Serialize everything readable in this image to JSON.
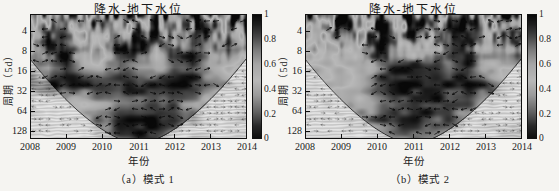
{
  "figure": {
    "panels": [
      {
        "title": "降水-地下水位",
        "ylabel": "周期（5d）",
        "xlabel": "年份",
        "caption": "（a）模式 1",
        "x_ticks": [
          "2008",
          "2009",
          "2010",
          "2011",
          "2012",
          "2013",
          "2014"
        ],
        "y_ticks": [
          "4",
          "8",
          "16",
          "32",
          "64",
          "128"
        ],
        "colorbar_ticks": [
          "1",
          "0.8",
          "0.6",
          "0.4",
          "0.2",
          "0"
        ]
      },
      {
        "title": "降水-地下水位",
        "ylabel": "周期（5d）",
        "xlabel": "年份",
        "caption": "（b）模式 2",
        "x_ticks": [
          "2008",
          "2009",
          "2010",
          "2011",
          "2012",
          "2013",
          "2014"
        ],
        "y_ticks": [
          "4",
          "8",
          "16",
          "32",
          "64",
          "128"
        ],
        "colorbar_ticks": [
          "1",
          "0.8",
          "0.6",
          "0.4",
          "0.2",
          "0"
        ]
      }
    ]
  },
  "chart_data": [
    {
      "type": "heatmap",
      "subtype": "wavelet-coherence",
      "title": "降水-地下水位",
      "xlabel": "年份",
      "ylabel": "周期（5d）",
      "caption": "（a）模式 1",
      "x_range": [
        2008,
        2014
      ],
      "x_tick_values": [
        2008,
        2009,
        2010,
        2011,
        2012,
        2013,
        2014
      ],
      "y_tick_values": [
        4,
        8,
        16,
        32,
        64,
        128
      ],
      "y_scale": "log2",
      "colorbar": {
        "min": 0,
        "max": 1,
        "ticks": [
          0,
          0.2,
          0.4,
          0.6,
          0.8,
          1
        ]
      },
      "features": [
        "cone-of-influence",
        "phase-arrows",
        "grayscale-print"
      ],
      "grid": {
        "x": [
          2008,
          2008.5,
          2009,
          2009.5,
          2010,
          2010.5,
          2011,
          2011.5,
          2012,
          2012.5,
          2013,
          2013.5,
          2014
        ],
        "periods": [
          3,
          6,
          12,
          22,
          32,
          45,
          90,
          150
        ],
        "values": [
          [
            0.85,
            0.3,
            0.9,
            0.5,
            0.85,
            0.95,
            0.4,
            0.9,
            0.6,
            0.9,
            0.35,
            0.85,
            0.6
          ],
          [
            0.5,
            0.9,
            0.7,
            0.4,
            0.9,
            0.5,
            0.85,
            0.9,
            0.45,
            0.95,
            0.8,
            0.5,
            0.85
          ],
          [
            0.5,
            0.8,
            0.95,
            0.5,
            0.4,
            0.9,
            0.95,
            0.5,
            0.85,
            0.95,
            0.55,
            0.9,
            0.5
          ],
          [
            0.75,
            0.55,
            0.9,
            0.6,
            0.5,
            0.8,
            0.6,
            0.55,
            0.75,
            0.85,
            0.6,
            0.5,
            0.45
          ],
          [
            0.9,
            0.95,
            0.95,
            0.9,
            0.95,
            0.9,
            0.85,
            0.9,
            0.95,
            0.9,
            0.8,
            0.7,
            0.6
          ],
          [
            0.45,
            0.5,
            0.55,
            0.5,
            0.6,
            0.7,
            0.8,
            0.85,
            0.75,
            0.65,
            0.5,
            0.45,
            0.4
          ],
          [
            0.35,
            0.4,
            0.45,
            0.55,
            0.75,
            0.9,
            0.95,
            0.95,
            0.9,
            0.8,
            0.5,
            0.4,
            0.35
          ],
          [
            0.4,
            0.4,
            0.45,
            0.5,
            0.65,
            0.8,
            0.9,
            0.85,
            0.6,
            0.3,
            0.35,
            0.4,
            0.4
          ]
        ]
      }
    },
    {
      "type": "heatmap",
      "subtype": "wavelet-coherence",
      "title": "降水-地下水位",
      "xlabel": "年份",
      "ylabel": "周期（5d）",
      "caption": "（b）模式 2",
      "x_range": [
        2008,
        2014
      ],
      "x_tick_values": [
        2008,
        2009,
        2010,
        2011,
        2012,
        2013,
        2014
      ],
      "y_tick_values": [
        4,
        8,
        16,
        32,
        64,
        128
      ],
      "y_scale": "log2",
      "colorbar": {
        "min": 0,
        "max": 1,
        "ticks": [
          0,
          0.2,
          0.4,
          0.6,
          0.8,
          1
        ]
      },
      "features": [
        "cone-of-influence",
        "phase-arrows",
        "grayscale-print"
      ],
      "grid": {
        "x": [
          2008,
          2008.5,
          2009,
          2009.5,
          2010,
          2010.5,
          2011,
          2011.5,
          2012,
          2012.5,
          2013,
          2013.5,
          2014
        ],
        "periods": [
          3,
          6,
          12,
          22,
          32,
          45,
          90,
          150
        ],
        "values": [
          [
            0.9,
            0.4,
            0.85,
            0.6,
            0.95,
            0.5,
            0.9,
            0.85,
            0.5,
            0.9,
            0.6,
            0.9,
            0.5
          ],
          [
            0.6,
            0.5,
            0.9,
            0.5,
            0.9,
            0.6,
            0.85,
            0.5,
            0.8,
            0.9,
            0.5,
            0.85,
            0.9
          ],
          [
            0.5,
            0.45,
            0.55,
            0.5,
            0.9,
            0.6,
            0.5,
            0.45,
            0.85,
            0.9,
            0.6,
            0.5,
            0.85
          ],
          [
            0.55,
            0.5,
            0.45,
            0.5,
            0.7,
            0.9,
            0.95,
            0.9,
            0.8,
            0.9,
            0.6,
            0.5,
            0.6
          ],
          [
            0.6,
            0.5,
            0.45,
            0.55,
            0.85,
            0.95,
            0.95,
            0.95,
            0.9,
            0.95,
            0.85,
            0.6,
            0.5
          ],
          [
            0.5,
            0.55,
            0.5,
            0.6,
            0.7,
            0.85,
            0.9,
            0.9,
            0.85,
            0.8,
            0.6,
            0.5,
            0.45
          ],
          [
            0.4,
            0.45,
            0.55,
            0.65,
            0.8,
            0.9,
            0.9,
            0.85,
            0.8,
            0.6,
            0.45,
            0.4,
            0.35
          ],
          [
            0.4,
            0.4,
            0.45,
            0.5,
            0.6,
            0.7,
            0.75,
            0.7,
            0.55,
            0.4,
            0.35,
            0.4,
            0.4
          ]
        ]
      }
    }
  ]
}
